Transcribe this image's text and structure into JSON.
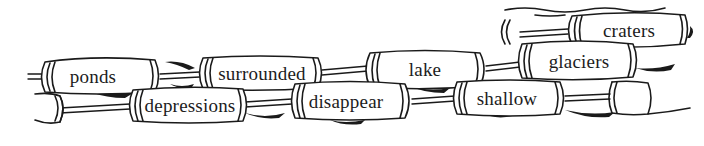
{
  "illustration": {
    "description": "Words written on floating logs tied together with rope",
    "stroke_color": "#1a1a1a",
    "log_fill": "#ffffff",
    "words": [
      {
        "id": "ponds",
        "label": "ponds",
        "x": 93,
        "y": 76
      },
      {
        "id": "surrounded",
        "label": "surrounded",
        "x": 262,
        "y": 73
      },
      {
        "id": "lake",
        "label": "lake",
        "x": 425,
        "y": 69
      },
      {
        "id": "glaciers",
        "label": "glaciers",
        "x": 579,
        "y": 61
      },
      {
        "id": "craters",
        "label": "craters",
        "x": 629,
        "y": 30
      },
      {
        "id": "depressions",
        "label": "depressions",
        "x": 190,
        "y": 105
      },
      {
        "id": "disappear",
        "label": "disappear",
        "x": 346,
        "y": 101
      },
      {
        "id": "shallow",
        "label": "shallow",
        "x": 507,
        "y": 98
      }
    ]
  }
}
